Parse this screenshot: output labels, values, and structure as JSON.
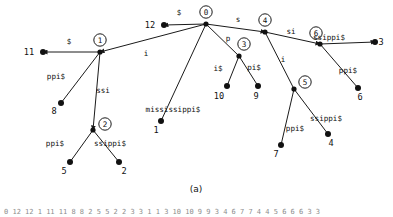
{
  "figure": {
    "caption": "(a)",
    "colors": {
      "stroke": "#1a1a1a",
      "node": "#111111",
      "text": "#101010"
    }
  },
  "tree": {
    "internal_nodes": [
      {
        "id": "0",
        "label": "0",
        "x": 206,
        "y": 24,
        "ring_dx": 0,
        "ring_dy": -12
      },
      {
        "id": "1",
        "label": "1",
        "x": 100,
        "y": 52,
        "ring_dx": 0,
        "ring_dy": -12
      },
      {
        "id": "2",
        "label": "2",
        "x": 93,
        "y": 130,
        "ring_dx": 12,
        "ring_dy": -6
      },
      {
        "id": "3",
        "label": "3",
        "x": 239,
        "y": 56,
        "ring_dx": 5,
        "ring_dy": -12
      },
      {
        "id": "4",
        "label": "4",
        "x": 265,
        "y": 32,
        "ring_dx": 0,
        "ring_dy": -12
      },
      {
        "id": "5",
        "label": "5",
        "x": 294,
        "y": 89,
        "ring_dx": 11,
        "ring_dy": -7
      },
      {
        "id": "6",
        "label": "6",
        "x": 320,
        "y": 44,
        "ring_dx": -4,
        "ring_dy": -11
      }
    ],
    "leaves": [
      {
        "id": "12",
        "label": "12",
        "x": 164,
        "y": 25,
        "tx": 150,
        "ty": 28
      },
      {
        "id": "11",
        "label": "11",
        "x": 43,
        "y": 52,
        "tx": 29,
        "ty": 55
      },
      {
        "id": "8",
        "label": "8",
        "x": 61,
        "y": 103,
        "tx": 54,
        "ty": 114
      },
      {
        "id": "5L",
        "label": "5",
        "x": 70,
        "y": 162,
        "tx": 64,
        "ty": 174
      },
      {
        "id": "2L",
        "label": "2",
        "x": 119,
        "y": 162,
        "tx": 124,
        "ty": 174
      },
      {
        "id": "1L",
        "label": "1",
        "x": 161,
        "y": 121,
        "tx": 156,
        "ty": 133
      },
      {
        "id": "10",
        "label": "10",
        "x": 227,
        "y": 86,
        "tx": 219,
        "ty": 99
      },
      {
        "id": "9",
        "label": "9",
        "x": 258,
        "y": 86,
        "tx": 256,
        "ty": 99
      },
      {
        "id": "7",
        "label": "7",
        "x": 281,
        "y": 145,
        "tx": 276,
        "ty": 157
      },
      {
        "id": "4L",
        "label": "4",
        "x": 328,
        "y": 134,
        "tx": 331,
        "ty": 146
      },
      {
        "id": "6L",
        "label": "6",
        "x": 358,
        "y": 88,
        "tx": 360,
        "ty": 100
      },
      {
        "id": "3L",
        "label": "3",
        "x": 375,
        "y": 42,
        "tx": 381,
        "ty": 45
      }
    ],
    "edges": [
      {
        "from": "0",
        "to": "12",
        "label": "$",
        "lx": 179,
        "ly": 15,
        "arrow": "end"
      },
      {
        "from": "0",
        "to": "1",
        "label": "i",
        "lx": 146,
        "ly": 56,
        "arrow": "end"
      },
      {
        "from": "0",
        "to": "1L",
        "label": "mississippi$",
        "lx": 173,
        "ly": 112,
        "arrow": "none"
      },
      {
        "from": "0",
        "to": "3",
        "label": "p",
        "lx": 228,
        "ly": 41,
        "arrow": "none"
      },
      {
        "from": "0",
        "to": "4",
        "label": "s",
        "lx": 238,
        "ly": 22,
        "arrow": "end"
      },
      {
        "from": "1",
        "to": "11",
        "label": "$",
        "lx": 69,
        "ly": 44,
        "arrow": "end"
      },
      {
        "from": "1",
        "to": "8",
        "label": "ppi$",
        "lx": 56,
        "ly": 79,
        "arrow": "none"
      },
      {
        "from": "1",
        "to": "2",
        "label": "ssi",
        "lx": 103,
        "ly": 93,
        "arrow": "end"
      },
      {
        "from": "2",
        "to": "5L",
        "label": "ppi$",
        "lx": 55,
        "ly": 146,
        "arrow": "none"
      },
      {
        "from": "2",
        "to": "2L",
        "label": "ssippi$",
        "lx": 110,
        "ly": 146,
        "arrow": "none"
      },
      {
        "from": "3",
        "to": "10",
        "label": "i$",
        "lx": 218,
        "ly": 71,
        "arrow": "none"
      },
      {
        "from": "3",
        "to": "9",
        "label": "pi$",
        "lx": 254,
        "ly": 70,
        "arrow": "none"
      },
      {
        "from": "4",
        "to": "6",
        "label": "si",
        "lx": 291,
        "ly": 34,
        "arrow": "end"
      },
      {
        "from": "4",
        "to": "5",
        "label": "i",
        "lx": 283,
        "ly": 62,
        "arrow": "none"
      },
      {
        "from": "5",
        "to": "7",
        "label": "ppi$",
        "lx": 295,
        "ly": 131,
        "arrow": "none"
      },
      {
        "from": "5",
        "to": "4L",
        "label": "ssippi$",
        "lx": 326,
        "ly": 121,
        "arrow": "none"
      },
      {
        "from": "6",
        "to": "3L",
        "label": "ssippi$",
        "lx": 329,
        "ly": 40,
        "arrow": "end"
      },
      {
        "from": "6",
        "to": "6L",
        "label": "ppi$",
        "lx": 348,
        "ly": 73,
        "arrow": "none"
      }
    ]
  },
  "bottom_strip": {
    "visible": true,
    "text": "0 12 12 1 11 11 8 8 2 5 5 2 2 3 3 1 1 3 10 10 9 9 3 4 6 7 7 4 4 5 6 6 6 3 3"
  }
}
